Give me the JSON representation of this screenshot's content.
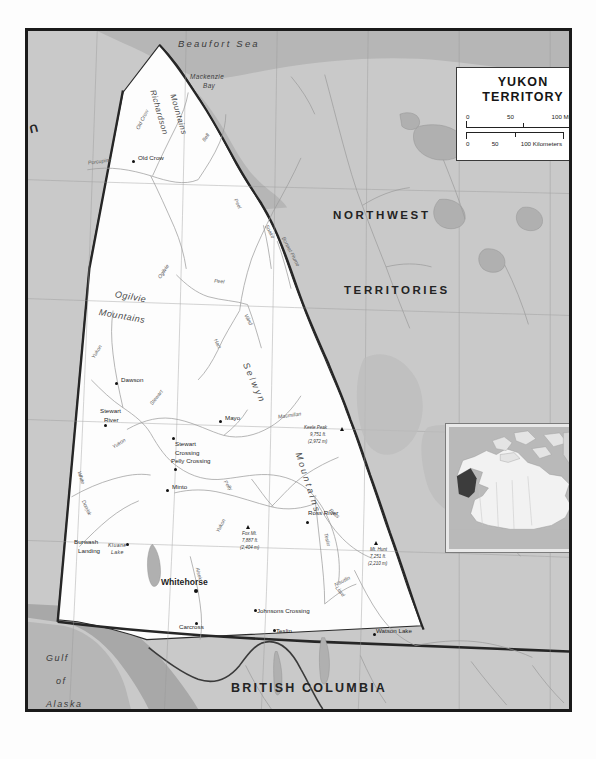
{
  "map": {
    "title_line1": "YUKON",
    "title_line2": "TERRITORY",
    "scale_miles": {
      "t0": "0",
      "t50": "50",
      "t100": "100 Miles"
    },
    "scale_km": {
      "t0": "0",
      "t50": "50",
      "t100": "100 Kilometers"
    }
  },
  "regions": [
    {
      "name": "united-states",
      "label": "UNITED STATES"
    },
    {
      "name": "northwest",
      "label": "NORTHWEST"
    },
    {
      "name": "territories",
      "label": "TERRITORIES"
    },
    {
      "name": "british-columbia",
      "label": "BRITISH COLUMBIA"
    }
  ],
  "water": {
    "beaufort_sea": "Beaufort  Sea",
    "mackenzie_bay_l1": "Mackenzie",
    "mackenzie_bay_l2": "Bay",
    "gulf_l1": "Gulf",
    "gulf_l2": "of",
    "gulf_l3": "Alaska",
    "kluane_l1": "Kluane",
    "kluane_l2": "Lake"
  },
  "ranges": [
    {
      "name": "richardson-mountains",
      "l1": "Richardson",
      "l2": "Mountains"
    },
    {
      "name": "ogilvie-mountains",
      "l1": "Ogilvie",
      "l2": "Mountains"
    },
    {
      "name": "selwyn-mountains",
      "l1": "Selwyn",
      "l2": "Mountains"
    }
  ],
  "towns": [
    {
      "name": "old-crow",
      "label": "Old Crow",
      "capital": false
    },
    {
      "name": "dawson",
      "label": "Dawson",
      "capital": false
    },
    {
      "name": "mayo",
      "label": "Mayo",
      "capital": false
    },
    {
      "name": "stewart-river",
      "label": "Stewart\nRiver",
      "capital": false
    },
    {
      "name": "stewart-crossing",
      "label": "Stewart\nCrossing",
      "capital": false
    },
    {
      "name": "pelly-crossing",
      "label": "Pelly Crossing",
      "capital": false
    },
    {
      "name": "minto",
      "label": "Minto",
      "capital": false
    },
    {
      "name": "ross-river",
      "label": "Ross River",
      "capital": false
    },
    {
      "name": "burwash-landing",
      "label": "Burwash\nLanding",
      "capital": false
    },
    {
      "name": "whitehorse",
      "label": "Whitehorse",
      "capital": true
    },
    {
      "name": "carcross",
      "label": "Carcross",
      "capital": false
    },
    {
      "name": "johnsons-crossing",
      "label": "Johnsons Crossing",
      "capital": false
    },
    {
      "name": "teslin",
      "label": "Teslin",
      "capital": false
    },
    {
      "name": "watson-lake",
      "label": "Watson Lake",
      "capital": false
    }
  ],
  "town_labels": {
    "old_crow": "Old Crow",
    "dawson": "Dawson",
    "mayo": "Mayo",
    "stewart_river_1": "Stewart",
    "stewart_river_2": "River",
    "stewart_crossing_1": "Stewart",
    "stewart_crossing_2": "Crossing",
    "pelly_crossing": "Pelly Crossing",
    "minto": "Minto",
    "ross_river": "Ross River",
    "burwash_1": "Burwash",
    "burwash_2": "Landing",
    "whitehorse": "Whitehorse",
    "carcross": "Carcross",
    "johnsons_crossing": "Johnsons Crossing",
    "teslin": "Teslin",
    "watson_lake": "Watson Lake"
  },
  "peaks": [
    {
      "name": "keele-peak",
      "label": "Keele Peak",
      "ft": "9,751 ft.",
      "m": "(2,972 m)"
    },
    {
      "name": "fox-mt",
      "label": "Fox Mt.",
      "ft": "7,887 ft.",
      "m": "(2,404 m)"
    },
    {
      "name": "mt-hunt",
      "label": "Mt. Hunt",
      "ft": "7,251 ft.",
      "m": "(2,210 m)"
    }
  ],
  "rivers": [
    {
      "name": "porcupine-river",
      "label": "Porcupine"
    },
    {
      "name": "old-crow-river",
      "label": "Old Crow"
    },
    {
      "name": "bell-river",
      "label": "Bell"
    },
    {
      "name": "peel-river",
      "label": "Peel"
    },
    {
      "name": "peel-river-2",
      "label": "Peel"
    },
    {
      "name": "ogilvie-river",
      "label": "Ogilvie"
    },
    {
      "name": "hart-river",
      "label": "Hart"
    },
    {
      "name": "bonnet-plume",
      "label": "Bonnet Plume"
    },
    {
      "name": "snake-river",
      "label": "Snake"
    },
    {
      "name": "wind-river",
      "label": "Wind"
    },
    {
      "name": "stewart-river-r",
      "label": "Stewart"
    },
    {
      "name": "yukon-river-1",
      "label": "Yukon"
    },
    {
      "name": "yukon-river-2",
      "label": "Yukon"
    },
    {
      "name": "yukon-river-3",
      "label": "Yukon"
    },
    {
      "name": "white-river",
      "label": "White"
    },
    {
      "name": "donjek-river",
      "label": "Donjek"
    },
    {
      "name": "pelly-river",
      "label": "Pelly"
    },
    {
      "name": "macmillan-river",
      "label": "Macmillan"
    },
    {
      "name": "ross-river-r",
      "label": "Ross"
    },
    {
      "name": "alsek-river",
      "label": "Alsek"
    },
    {
      "name": "teslin-river",
      "label": "Teslin"
    },
    {
      "name": "liard-river",
      "label": "Liard"
    },
    {
      "name": "nisutlin-river",
      "label": "Nisutlin"
    }
  ],
  "colors": {
    "land_outside": "#c9c9c9",
    "land_yukon": "#fdfdfd",
    "water": "#b3b3b3",
    "border": "#1b1b1b",
    "inset_highlight": "#3c3c3c"
  }
}
